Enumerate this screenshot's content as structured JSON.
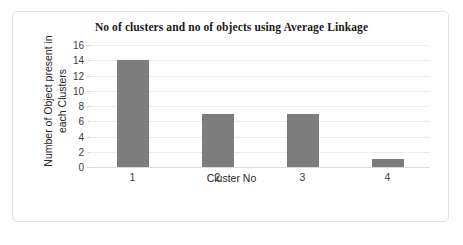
{
  "chart_data": {
    "type": "bar",
    "title": "No of clusters and no of objects using Average Linkage",
    "xlabel": "Cluster No",
    "ylabel": "Number of Object present in each Clusters",
    "ylabel_lines": [
      "Number of Object present in",
      "each Clusters"
    ],
    "categories": [
      "1",
      "2",
      "3",
      "4"
    ],
    "values": [
      14,
      7,
      7,
      1
    ],
    "series": [
      {
        "name": "Number of Object present in each Clusters",
        "values": [
          14,
          7,
          7,
          1
        ]
      }
    ],
    "ylim": [
      0,
      16
    ],
    "ytick_step": 2,
    "yticks": [
      0,
      2,
      4,
      6,
      8,
      10,
      12,
      14,
      16
    ],
    "ytick_labels": [
      "0",
      "2",
      "4",
      "6",
      "8",
      "10",
      "12",
      "14",
      "16"
    ],
    "grid": true,
    "grid_axis": "y",
    "legend": false,
    "legend_position": "none",
    "bar_color": "#7d7d7d",
    "gridline_color": "#ececec",
    "axis_line_color": "#dcdcdc",
    "background_color": "#ffffff",
    "border_color": "#e2e2e2",
    "text_color": "#262626"
  }
}
